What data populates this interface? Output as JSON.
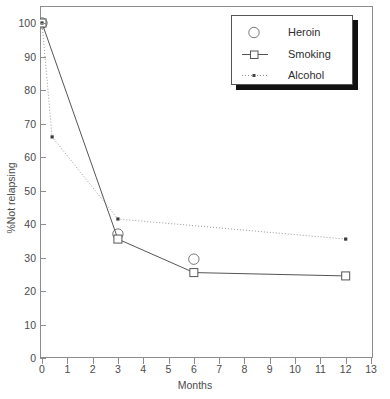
{
  "chart_data": {
    "type": "line",
    "title": "",
    "xlabel": "Months",
    "ylabel": "%Not relapsing",
    "xlim": [
      0,
      13
    ],
    "ylim": [
      0,
      100
    ],
    "xticks": [
      0,
      1,
      2,
      3,
      4,
      5,
      6,
      7,
      8,
      9,
      10,
      11,
      12,
      13
    ],
    "yticks": [
      0,
      10,
      20,
      30,
      40,
      50,
      60,
      70,
      80,
      90,
      100
    ],
    "grid": false,
    "legend_position": "top-right",
    "series": [
      {
        "name": "Heroin",
        "marker": "circle",
        "line": "none",
        "color": "#555555",
        "points": [
          {
            "x": 0,
            "y": 100
          },
          {
            "x": 3,
            "y": 37
          },
          {
            "x": 6,
            "y": 29.5
          }
        ]
      },
      {
        "name": "Smoking",
        "marker": "square",
        "line": "solid",
        "color": "#555555",
        "points": [
          {
            "x": 0,
            "y": 100
          },
          {
            "x": 3,
            "y": 35.5
          },
          {
            "x": 6,
            "y": 25.5
          },
          {
            "x": 12,
            "y": 24.5
          }
        ]
      },
      {
        "name": "Alcohol",
        "marker": "dot",
        "line": "dotted",
        "color": "#9a9a9a",
        "points": [
          {
            "x": 0,
            "y": 100
          },
          {
            "x": 0.4,
            "y": 66
          },
          {
            "x": 3,
            "y": 41.5
          },
          {
            "x": 12,
            "y": 35.5
          }
        ]
      }
    ]
  },
  "legend": {
    "entries": [
      {
        "label": "Heroin"
      },
      {
        "label": "Smoking"
      },
      {
        "label": "Alcohol"
      }
    ]
  }
}
